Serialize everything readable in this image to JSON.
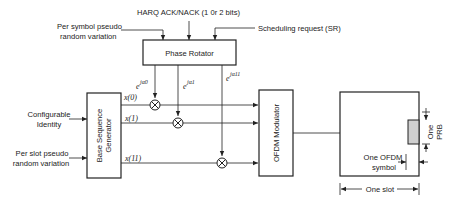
{
  "diagram": {
    "type": "block-diagram",
    "inputs": {
      "harq": "HARQ ACK/NACK (1 0r 2 bits)",
      "per_symbol_line1": "Per symbol pseudo",
      "per_symbol_line2": "random variation",
      "sr": "Scheduling request (SR)",
      "config_line1": "Configurable",
      "config_line2": "Identity",
      "per_slot_line1": "Per slot pseudo",
      "per_slot_line2": "random variation"
    },
    "blocks": {
      "phase_rotator": "Phase Rotator",
      "base_seq_line1": "Base Sequence",
      "base_seq_line2": "Generator",
      "ofdm_modulator": "OFDM Modulator"
    },
    "phases": [
      {
        "base": "e",
        "exp": "jα0"
      },
      {
        "base": "e",
        "exp": "jα1"
      },
      {
        "base": "e",
        "exp": "jα11"
      }
    ],
    "sequence_outputs": [
      "x(0)",
      "x(1)",
      "x(11)"
    ],
    "resource_grid": {
      "prb_line1": "One",
      "prb_line2": "PRB",
      "symbol_line1": "One OFDM",
      "symbol_line2": "symbol",
      "slot": "One slot"
    },
    "colors": {
      "stroke": "#222222",
      "prb_fill": "#cfcfcf",
      "background": "#ffffff"
    }
  }
}
